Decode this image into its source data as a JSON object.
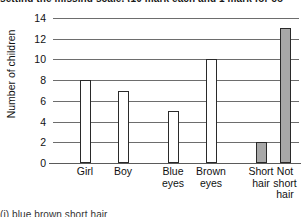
{
  "page": {
    "top_cropped_line": "setting the missing scale. (10 mark each and 1 mark for co",
    "bottom_cropped_line": "(i)                            blue     brown    short   hair"
  },
  "chart_data": {
    "type": "bar",
    "title": "",
    "xlabel": "",
    "ylabel": "Number of children",
    "categories": [
      "Girl",
      "Boy",
      "Blue eyes",
      "Brown eyes",
      "Short hair",
      "Not short hair"
    ],
    "category_lines": [
      [
        "Girl"
      ],
      [
        "Boy"
      ],
      [
        "Blue",
        "eyes"
      ],
      [
        "Brown",
        "eyes"
      ],
      [
        "Short",
        "hair"
      ],
      [
        "Not",
        "short",
        "hair"
      ]
    ],
    "values": [
      8,
      7,
      5,
      10,
      2,
      13
    ],
    "bar_fills": [
      "white",
      "white",
      "white",
      "white",
      "gray",
      "gray"
    ],
    "ylim": [
      0,
      14
    ],
    "ytick_values": [
      0,
      2,
      4,
      6,
      8,
      10,
      12,
      14
    ],
    "ytick_labels": [
      "0",
      "2",
      "4",
      "6",
      "8",
      "10",
      "12",
      "14"
    ],
    "grid": true,
    "grid_orientation": "horizontal",
    "legend": null,
    "colors": {
      "bar_outline": "#2a2a2a",
      "bar_fill_white": "#ffffff",
      "bar_fill_gray": "#a8a8a8",
      "gridline": "#6d6d6d",
      "axis": "#5a5a5a",
      "text": "#111111",
      "background": "#ffffff"
    }
  }
}
